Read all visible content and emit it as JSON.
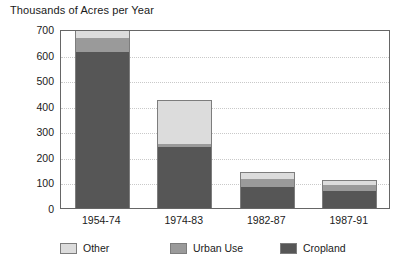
{
  "chart_data": {
    "type": "bar",
    "subtype": "stacked-vertical",
    "title": "Thousands of Acres per Year",
    "xlabel": "",
    "ylabel": "",
    "ylim": [
      0,
      700
    ],
    "ytick_step": 100,
    "yticks": [
      700,
      600,
      500,
      400,
      300,
      200,
      100,
      0
    ],
    "ytick_labels": [
      "700",
      "600",
      "500",
      "400",
      "300",
      "200",
      "100",
      "0"
    ],
    "grid": true,
    "grid_axis": "y",
    "grid_style": "dotted",
    "legend_position": "bottom",
    "categories": [
      "1954-74",
      "1974-83",
      "1982-87",
      "1987-91"
    ],
    "series": [
      {
        "name": "Cropland",
        "color": "#565656",
        "values": [
          610,
          238,
          82,
          66
        ]
      },
      {
        "name": "Urban Use",
        "color": "#9a9a9a",
        "values": [
          55,
          12,
          31,
          24
        ]
      },
      {
        "name": "Other",
        "color": "#dcdcdc",
        "values": [
          35,
          172,
          28,
          19
        ]
      }
    ],
    "stack_order_bottom_to_top": [
      "Cropland",
      "Urban Use",
      "Other"
    ],
    "totals": [
      700,
      422,
      141,
      109
    ]
  },
  "legend": {
    "items": [
      {
        "label": "Other",
        "color": "#dcdcdc"
      },
      {
        "label": "Urban Use",
        "color": "#9a9a9a"
      },
      {
        "label": "Cropland",
        "color": "#565656"
      }
    ]
  },
  "colors": {
    "other": "#dcdcdc",
    "urban_use": "#9a9a9a",
    "cropland": "#565656",
    "axis": "#666666",
    "gridline": "#c9c9c9",
    "text": "#1a1a1a",
    "background": "#ffffff"
  }
}
